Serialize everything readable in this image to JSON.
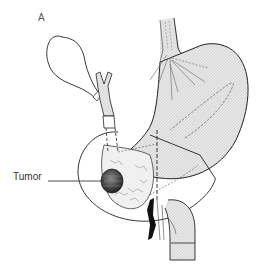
{
  "figure": {
    "panel_label": "A",
    "labels": {
      "tumor": "Tumor"
    },
    "structures": [
      "gallbladder",
      "bile-duct",
      "esophagus",
      "stomach",
      "duodenum",
      "pancreas",
      "tumor",
      "vagus-nerve-branches",
      "resection-lines"
    ],
    "colors": {
      "line": "#222222",
      "fill": "#e4e4e4",
      "tumor": "#444444"
    }
  }
}
